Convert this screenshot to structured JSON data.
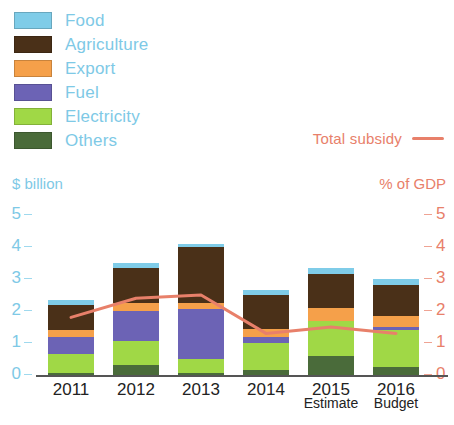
{
  "legend": {
    "items": [
      {
        "label": "Food",
        "color": "#7FCCE8"
      },
      {
        "label": "Agriculture",
        "color": "#4A3018"
      },
      {
        "label": "Export",
        "color": "#F5A04A"
      },
      {
        "label": "Fuel",
        "color": "#6C63B5"
      },
      {
        "label": "Electricity",
        "color": "#A0D846"
      },
      {
        "label": "Others",
        "color": "#4A6B3A"
      }
    ],
    "label_color": "#7EC9E6"
  },
  "total_key": {
    "label": "Total subsidy",
    "color": "#E8806A"
  },
  "axes": {
    "left_title": "$ billion",
    "right_title": "% of GDP",
    "left_ticks": [
      "5",
      "4",
      "3",
      "2",
      "1",
      "0"
    ],
    "right_ticks": [
      "5",
      "4",
      "3",
      "2",
      "1",
      "0"
    ],
    "left_color": "#7EC9E6",
    "right_color": "#E8806A"
  },
  "footnotes": {
    "estimate": "Estimate",
    "budget": "Budget"
  },
  "chart_data": {
    "type": "bar",
    "title": "",
    "subtitle": "",
    "xlabel": "",
    "ylabel": "$ billion",
    "y2label": "% of GDP",
    "ylim": [
      0,
      5
    ],
    "y2lim": [
      0,
      5
    ],
    "grid": false,
    "legend_position": "top-left",
    "stacked": true,
    "categories": [
      "2011",
      "2012",
      "2013",
      "2014",
      "2015",
      "2016"
    ],
    "category_notes": [
      "",
      "",
      "",
      "",
      "Estimate",
      "Budget"
    ],
    "series": [
      {
        "name": "Others",
        "color": "#4A6B3A",
        "values": [
          0.05,
          0.3,
          0.05,
          0.15,
          0.6,
          0.25
        ]
      },
      {
        "name": "Electricity",
        "color": "#A0D846",
        "values": [
          0.6,
          0.75,
          0.45,
          0.85,
          1.1,
          1.15
        ]
      },
      {
        "name": "Fuel",
        "color": "#6C63B5",
        "values": [
          0.55,
          0.95,
          1.55,
          0.2,
          0.0,
          0.1
        ]
      },
      {
        "name": "Export",
        "color": "#F5A04A",
        "values": [
          0.2,
          0.25,
          0.2,
          0.25,
          0.4,
          0.35
        ]
      },
      {
        "name": "Agriculture",
        "color": "#4A3018",
        "values": [
          0.8,
          1.1,
          1.75,
          1.05,
          1.05,
          0.95
        ]
      },
      {
        "name": "Food",
        "color": "#7FCCE8",
        "values": [
          0.15,
          0.15,
          0.1,
          0.15,
          0.2,
          0.2
        ]
      }
    ],
    "totals": [
      2.35,
      3.5,
      4.1,
      2.65,
      3.35,
      3.0
    ],
    "line": {
      "name": "Total subsidy",
      "color": "#E8806A",
      "axis": "right",
      "values": [
        1.8,
        2.4,
        2.5,
        1.3,
        1.5,
        1.3
      ]
    }
  }
}
